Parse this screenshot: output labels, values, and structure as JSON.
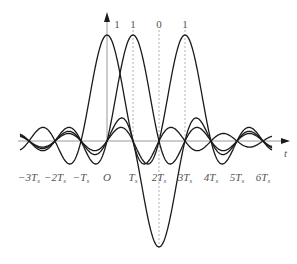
{
  "diagram": {
    "title": "",
    "x_axis_label": "t",
    "tick_labels": [
      {
        "text": "−3T",
        "sub": "s",
        "k": -3
      },
      {
        "text": "−2T",
        "sub": "s",
        "k": -2
      },
      {
        "text": "−T",
        "sub": "s",
        "k": -1
      },
      {
        "text": "O",
        "sub": "",
        "k": 0
      },
      {
        "text": "T",
        "sub": "s",
        "k": 1
      },
      {
        "text": "2T",
        "sub": "s",
        "k": 2
      },
      {
        "text": "3T",
        "sub": "s",
        "k": 3
      },
      {
        "text": "4T",
        "sub": "s",
        "k": 4
      },
      {
        "text": "5T",
        "sub": "s",
        "k": 5
      },
      {
        "text": "6T",
        "sub": "s",
        "k": 6
      }
    ],
    "bits": [
      {
        "label": "1",
        "k": 0,
        "amplitude": 1
      },
      {
        "label": "1",
        "k": 1,
        "amplitude": 1
      },
      {
        "label": "0",
        "k": 2,
        "amplitude": -1
      },
      {
        "label": "1",
        "k": 3,
        "amplitude": 1
      }
    ],
    "dashed_markers_k": [
      1,
      2,
      3
    ],
    "colors": {
      "curve": "#1a1a1a",
      "axis": "#9a9a9a",
      "dash": "#b0b0b0",
      "text": "#555555"
    }
  }
}
